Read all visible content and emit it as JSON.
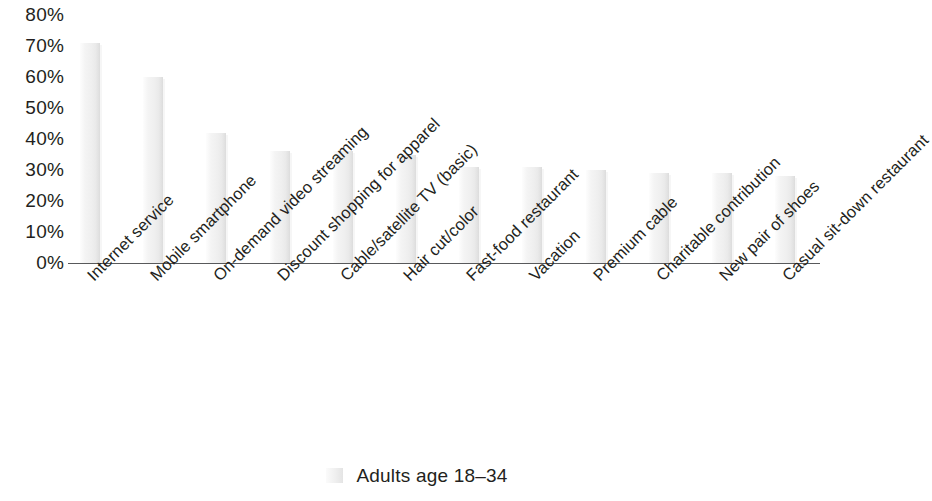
{
  "chart_data": {
    "type": "bar",
    "title": "",
    "subtitle": "",
    "xlabel": "",
    "ylabel": "",
    "ylim": [
      0,
      80
    ],
    "grid": false,
    "legend_position": "bottom-center",
    "categories": [
      "Internet service",
      "Mobile smartphone",
      "On-demand video streaming",
      "Discount shopping for apparel",
      "Cable/satellite TV (basic)",
      "Hair cut/color",
      "Fast-food restaurant",
      "Vacation",
      "Premium cable",
      "Charitable contribution",
      "New pair of shoes",
      "Casual sit-down restaurant"
    ],
    "series": [
      {
        "name": "Adults age 18–34",
        "color": "#efefef",
        "values": [
          71,
          60,
          42,
          36,
          36,
          35,
          31,
          31,
          30,
          29,
          29,
          28
        ]
      }
    ],
    "y_tick_labels": [
      "80%",
      "70%",
      "60%",
      "50%",
      "40%",
      "30%",
      "20%",
      "10%",
      "0%"
    ],
    "y_tick_values": [
      80,
      70,
      60,
      50,
      40,
      30,
      20,
      10,
      0
    ]
  },
  "legend": {
    "entries": [
      {
        "label": "Adults age 18–34",
        "swatch_color": "#efefef"
      }
    ]
  },
  "colors": {
    "bar_fill": "#efefef",
    "axis_line": "#58595b",
    "text": "#231f20",
    "background": "#ffffff"
  }
}
